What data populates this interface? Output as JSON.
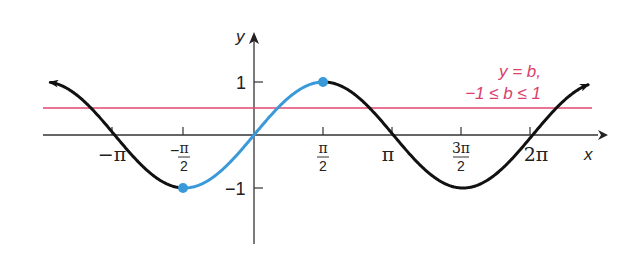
{
  "chart_data": {
    "type": "line",
    "title": "",
    "xlabel": "x",
    "ylabel": "y",
    "xlim": [
      -4.8,
      7.6
    ],
    "ylim": [
      -1.9,
      1.6
    ],
    "grid": false,
    "x_ticks": [
      "−π",
      "−π/2",
      "π/2",
      "π",
      "3π/2",
      "2π"
    ],
    "x_tick_values": [
      -3.1416,
      -1.5708,
      1.5708,
      3.1416,
      4.7124,
      6.2832
    ],
    "y_ticks": [
      "1",
      "−1"
    ],
    "y_tick_values": [
      1,
      -1
    ],
    "series": [
      {
        "name": "y = sin x",
        "color": "#111111",
        "domain": [
          -4.4,
          7.5
        ],
        "function": "sin(x)"
      },
      {
        "name": "y = sin x, −π/2 ≤ x ≤ π/2 (restricted)",
        "color": "#3a9ad9",
        "domain": [
          -1.5708,
          1.5708
        ],
        "function": "sin(x)",
        "endpoints": [
          [
            -1.5708,
            -1
          ],
          [
            1.5708,
            1
          ]
        ]
      },
      {
        "name": "y = b",
        "color": "#e0486e",
        "value": 0.5
      }
    ],
    "annotations": [
      {
        "text_line1": "y = b,",
        "text_line2": "−1 ≤ b ≤ 1",
        "color": "#d9406a"
      }
    ]
  },
  "labels": {
    "x_axis": "x",
    "y_axis": "y",
    "ticks": {
      "neg_pi": "−π",
      "neg_pi2_num": "π",
      "neg_pi2_den": "2",
      "pi2_num": "π",
      "pi2_den": "2",
      "pi": "π",
      "three_pi2_num": "3π",
      "three_pi2_den": "2",
      "two_pi": "2π",
      "y_one": "1",
      "y_neg_one": "−1"
    },
    "annotation_line1": "y = b,",
    "annotation_line2": "−1 ≤ b ≤ 1"
  }
}
